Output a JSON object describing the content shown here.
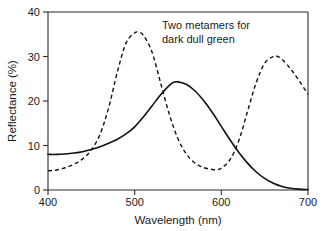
{
  "chart_data": {
    "type": "line",
    "title": "",
    "xlabel": "Wavelength (nm)",
    "ylabel": "Reflectance (%)",
    "xlim": [
      400,
      700
    ],
    "ylim": [
      0,
      40
    ],
    "xticks": [
      400,
      500,
      600,
      700
    ],
    "yticks": [
      0,
      10,
      20,
      30,
      40
    ],
    "xtick_labels": [
      "400",
      "500",
      "600",
      "700"
    ],
    "ytick_labels": [
      "0",
      "10",
      "20",
      "30",
      "40"
    ],
    "grid": false,
    "legend": "none",
    "annotations": [
      {
        "name": "chart-annotation",
        "line1": "Two metamers for",
        "line2": "dark dull green",
        "x": 545,
        "y": 37
      }
    ],
    "series": [
      {
        "name": "metamer-solid",
        "style": "solid",
        "color": "#111111",
        "x": [
          400,
          410,
          420,
          430,
          440,
          450,
          460,
          470,
          480,
          490,
          500,
          510,
          520,
          530,
          540,
          545,
          550,
          560,
          570,
          580,
          590,
          600,
          610,
          620,
          630,
          640,
          650,
          660,
          670,
          680,
          690,
          700
        ],
        "y": [
          8.0,
          8.0,
          8.1,
          8.3,
          8.6,
          9.1,
          9.7,
          10.5,
          11.4,
          12.6,
          14.2,
          16.4,
          18.9,
          21.4,
          23.5,
          24.2,
          24.3,
          23.7,
          22.2,
          20.0,
          17.3,
          14.3,
          11.3,
          8.5,
          6.1,
          4.1,
          2.6,
          1.5,
          0.8,
          0.4,
          0.2,
          0.1
        ]
      },
      {
        "name": "metamer-dashed",
        "style": "dashed",
        "color": "#111111",
        "x": [
          400,
          410,
          420,
          430,
          440,
          450,
          460,
          470,
          480,
          490,
          500,
          505,
          510,
          520,
          530,
          540,
          550,
          560,
          570,
          580,
          590,
          595,
          600,
          610,
          620,
          630,
          640,
          650,
          660,
          665,
          670,
          680,
          690,
          700
        ],
        "y": [
          4.3,
          4.5,
          5.0,
          5.8,
          7.0,
          9.0,
          12.5,
          18.5,
          26.5,
          33.0,
          35.3,
          35.4,
          34.8,
          31.0,
          24.0,
          17.0,
          11.5,
          8.0,
          6.0,
          5.0,
          4.6,
          4.6,
          4.9,
          6.8,
          11.0,
          17.5,
          24.0,
          28.5,
          30.0,
          30.0,
          29.4,
          27.2,
          24.5,
          21.5
        ]
      }
    ]
  },
  "figure": {
    "background_color": "#ffffff",
    "axis_color": "#2b2b2b",
    "series_color": "#111111"
  }
}
